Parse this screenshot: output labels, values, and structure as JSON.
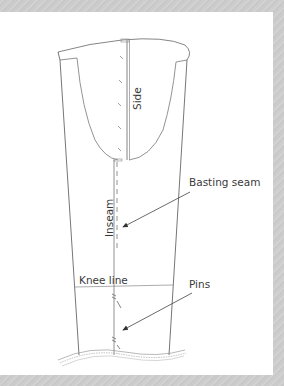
{
  "diagram": {
    "labels": {
      "side": "Side",
      "inseam": "Inseam",
      "basting_seam": "Basting seam",
      "knee_line": "Knee line",
      "pins": "Pins"
    },
    "colors": {
      "frame": "#cccccc",
      "panel": "#ffffff",
      "line": "#6e6e6e",
      "text": "#3a3a3a",
      "arrow": "#444444"
    }
  }
}
